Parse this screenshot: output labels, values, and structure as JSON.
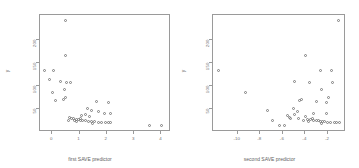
{
  "figure": {
    "background": "#ffffff",
    "marker_color": "#7d7d7d",
    "frame_color": "#9a9a9a",
    "marker_shape": "open-circle"
  },
  "chart_data": [
    {
      "type": "scatter",
      "title": "",
      "xlabel": "first SAVE predictor",
      "ylabel": "y",
      "xlim": [
        -0.45,
        4.35
      ],
      "ylim": [
        0,
        255
      ],
      "xticks": [
        0,
        1,
        2,
        3,
        4
      ],
      "xticklabels": [
        "0",
        "1",
        "2",
        "3",
        "4"
      ],
      "yticks": [
        50,
        100,
        150,
        200
      ],
      "yticklabels": [
        "50",
        "100",
        "150",
        "200"
      ],
      "grid": false,
      "legend": "none",
      "points": [
        [
          0.48,
          243
        ],
        [
          0.47,
          167
        ],
        [
          -0.3,
          135
        ],
        [
          0.05,
          134
        ],
        [
          -0.12,
          115
        ],
        [
          0.3,
          110
        ],
        [
          0.52,
          108
        ],
        [
          0.68,
          107
        ],
        [
          0.44,
          92
        ],
        [
          0.0,
          86
        ],
        [
          0.5,
          76
        ],
        [
          0.13,
          68
        ],
        [
          0.42,
          70
        ],
        [
          1.62,
          67
        ],
        [
          2.05,
          64
        ],
        [
          1.3,
          52
        ],
        [
          1.42,
          46
        ],
        [
          1.68,
          44
        ],
        [
          1.92,
          41
        ],
        [
          2.12,
          40
        ],
        [
          1.2,
          38
        ],
        [
          1.08,
          36
        ],
        [
          1.35,
          34
        ],
        [
          0.62,
          31
        ],
        [
          0.7,
          30
        ],
        [
          0.78,
          29
        ],
        [
          0.88,
          28
        ],
        [
          0.95,
          27
        ],
        [
          1.02,
          26
        ],
        [
          1.12,
          25
        ],
        [
          1.22,
          24
        ],
        [
          1.32,
          23
        ],
        [
          1.45,
          22
        ],
        [
          1.55,
          22
        ],
        [
          1.7,
          21
        ],
        [
          1.82,
          21
        ],
        [
          1.95,
          20
        ],
        [
          2.05,
          20
        ],
        [
          2.15,
          20
        ],
        [
          0.82,
          24
        ],
        [
          0.9,
          23
        ],
        [
          1.48,
          19
        ],
        [
          3.58,
          15
        ],
        [
          4.02,
          15
        ],
        [
          0.6,
          25
        ],
        [
          1.05,
          30
        ]
      ]
    },
    {
      "type": "scatter",
      "title": "",
      "xlabel": "second SAVE predictor",
      "ylabel": "y",
      "xlim": [
        -12.2,
        -0.4
      ],
      "ylim": [
        0,
        255
      ],
      "xticks": [
        -10,
        -8,
        -6,
        -4,
        -2
      ],
      "xticklabels": [
        "-10",
        "-8",
        "-6",
        "-4",
        "-2"
      ],
      "yticks": [
        50,
        100,
        150,
        200
      ],
      "yticklabels": [
        "50",
        "100",
        "150",
        "200"
      ],
      "grid": false,
      "legend": "none",
      "points": [
        [
          -1.05,
          243
        ],
        [
          -4.0,
          167
        ],
        [
          -11.7,
          135
        ],
        [
          -2.7,
          134
        ],
        [
          -1.7,
          133
        ],
        [
          -5.0,
          110
        ],
        [
          -3.6,
          108
        ],
        [
          -1.6,
          107
        ],
        [
          -2.6,
          92
        ],
        [
          -9.3,
          86
        ],
        [
          -1.95,
          76
        ],
        [
          -4.55,
          68
        ],
        [
          -4.35,
          70
        ],
        [
          -3.0,
          67
        ],
        [
          -2.1,
          64
        ],
        [
          -5.1,
          52
        ],
        [
          -7.4,
          46
        ],
        [
          -4.7,
          44
        ],
        [
          -3.3,
          41
        ],
        [
          -2.15,
          40
        ],
        [
          -4.95,
          38
        ],
        [
          -5.55,
          36
        ],
        [
          -3.95,
          34
        ],
        [
          -5.45,
          31
        ],
        [
          -5.3,
          30
        ],
        [
          -4.6,
          29
        ],
        [
          -3.8,
          28
        ],
        [
          -3.55,
          27
        ],
        [
          -3.25,
          26
        ],
        [
          -3.05,
          25
        ],
        [
          -2.85,
          24
        ],
        [
          -2.65,
          23
        ],
        [
          -2.45,
          22
        ],
        [
          -2.3,
          22
        ],
        [
          -2.0,
          21
        ],
        [
          -1.8,
          21
        ],
        [
          -1.4,
          20
        ],
        [
          -1.2,
          20
        ],
        [
          -1.0,
          20
        ],
        [
          -4.2,
          24
        ],
        [
          -3.7,
          23
        ],
        [
          -2.55,
          19
        ],
        [
          -6.3,
          15
        ],
        [
          -5.85,
          15
        ],
        [
          -6.9,
          25
        ],
        [
          -3.4,
          30
        ]
      ]
    }
  ]
}
